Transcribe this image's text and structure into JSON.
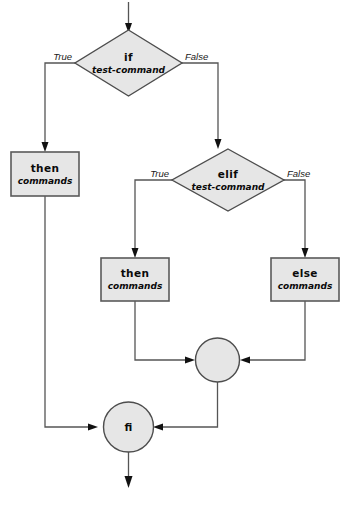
{
  "diagram": {
    "caption": "",
    "colors": {
      "node_fill": "#e6e6e6",
      "node_stroke": "#4d4d4d",
      "connector": "#555555",
      "arrowhead": "#111111",
      "text": "#0a0a0a",
      "background": "#ffffff"
    },
    "nodes": {
      "if_test": {
        "shape": "diamond",
        "keyword": "if",
        "sub": "test-command"
      },
      "then_outer": {
        "shape": "rectangle",
        "keyword": "then",
        "sub": "commands"
      },
      "elif_test": {
        "shape": "diamond",
        "keyword": "elif",
        "sub": "test-command"
      },
      "then_inner": {
        "shape": "rectangle",
        "keyword": "then",
        "sub": "commands"
      },
      "else_inner": {
        "shape": "rectangle",
        "keyword": "else",
        "sub": "commands"
      },
      "merge_inner": {
        "shape": "circle",
        "keyword": ""
      },
      "fi_end": {
        "shape": "circle",
        "keyword": "fi"
      }
    },
    "edge_labels": {
      "if_true": "True",
      "if_false": "False",
      "elif_true": "True",
      "elif_false": "False"
    }
  }
}
